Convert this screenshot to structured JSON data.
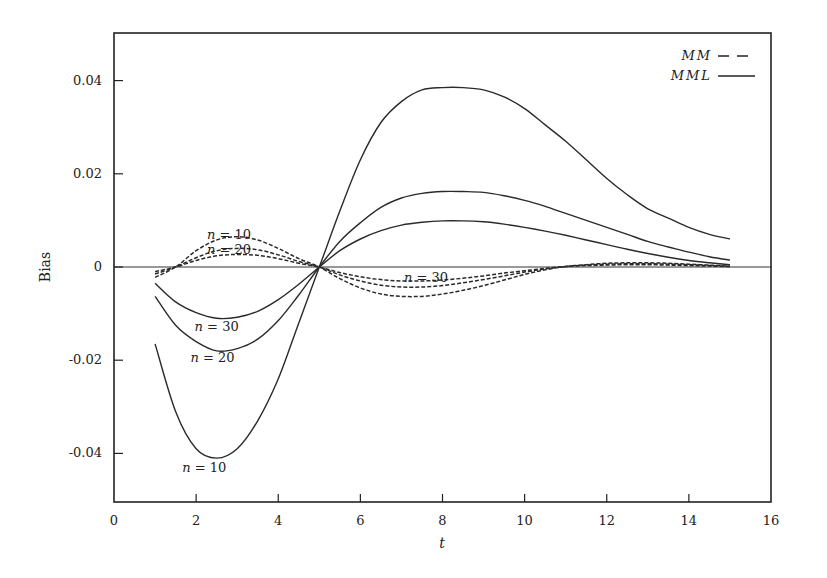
{
  "chart_data": {
    "type": "line",
    "title": "",
    "xlabel": "t",
    "ylabel": "Bias",
    "xlim": [
      0,
      16
    ],
    "ylim": [
      -0.05,
      0.05
    ],
    "xticks": [
      0,
      2,
      4,
      6,
      8,
      10,
      12,
      14,
      16
    ],
    "xtick_labels": [
      "0",
      "2",
      "4",
      "6",
      "8",
      "10",
      "12",
      "14",
      "16"
    ],
    "yticks": [
      -0.04,
      -0.02,
      0,
      0.02,
      0.04
    ],
    "ytick_labels": [
      "-0.04",
      "-0.02",
      "0",
      "0.02",
      "0.04"
    ],
    "grid": false,
    "zero_line": true,
    "legend": {
      "position": "upper right",
      "entries": [
        {
          "label": "MM",
          "style": "dashed"
        },
        {
          "label": "MML",
          "style": "solid"
        }
      ]
    },
    "x": [
      1,
      1.5,
      2,
      2.5,
      3,
      3.5,
      4,
      4.5,
      5,
      5.5,
      6,
      6.5,
      7,
      7.5,
      8,
      8.5,
      9,
      9.5,
      10,
      10.5,
      11,
      11.5,
      12,
      12.5,
      13,
      13.5,
      14,
      14.5,
      15
    ],
    "series": [
      {
        "name": "MML n = 10",
        "method": "MML",
        "n": 10,
        "style": "solid",
        "values": [
          -0.0165,
          -0.031,
          -0.039,
          -0.041,
          -0.039,
          -0.033,
          -0.024,
          -0.012,
          0.0,
          0.012,
          0.023,
          0.031,
          0.0355,
          0.038,
          0.0385,
          0.0385,
          0.038,
          0.0365,
          0.034,
          0.0305,
          0.027,
          0.023,
          0.019,
          0.0155,
          0.0125,
          0.0105,
          0.0085,
          0.007,
          0.006
        ]
      },
      {
        "name": "MML n = 20",
        "method": "MML",
        "n": 20,
        "style": "solid",
        "values": [
          -0.0063,
          -0.0125,
          -0.016,
          -0.018,
          -0.0175,
          -0.0155,
          -0.0115,
          -0.006,
          0.0,
          0.0055,
          0.0095,
          0.0128,
          0.0148,
          0.0158,
          0.0162,
          0.0162,
          0.016,
          0.0153,
          0.0143,
          0.013,
          0.0115,
          0.01,
          0.0085,
          0.007,
          0.0055,
          0.0043,
          0.0032,
          0.0022,
          0.0015
        ]
      },
      {
        "name": "MML n = 30",
        "method": "MML",
        "n": 30,
        "style": "solid",
        "values": [
          -0.0035,
          -0.0075,
          -0.0098,
          -0.011,
          -0.0108,
          -0.0095,
          -0.007,
          -0.0037,
          0.0,
          0.0035,
          0.006,
          0.0078,
          0.009,
          0.0096,
          0.0099,
          0.0099,
          0.0097,
          0.0092,
          0.0085,
          0.0077,
          0.0068,
          0.0058,
          0.0048,
          0.0038,
          0.0029,
          0.0021,
          0.0014,
          0.0009,
          0.0005
        ]
      },
      {
        "name": "MM n = 10",
        "method": "MM",
        "n": 10,
        "style": "dashed",
        "values": [
          -0.0022,
          0.0,
          0.0035,
          0.0058,
          0.0065,
          0.0058,
          0.004,
          0.0018,
          0.0,
          -0.0025,
          -0.0045,
          -0.0058,
          -0.0063,
          -0.0063,
          -0.0058,
          -0.005,
          -0.004,
          -0.0028,
          -0.0016,
          -0.0006,
          0.0001,
          0.0005,
          0.0008,
          0.0009,
          0.0009,
          0.0008,
          0.0006,
          0.0004,
          0.0002
        ]
      },
      {
        "name": "MM n = 20",
        "method": "MM",
        "n": 20,
        "style": "dashed",
        "values": [
          -0.0015,
          0.0,
          0.002,
          0.0035,
          0.004,
          0.0037,
          0.0026,
          0.0012,
          0.0,
          -0.0017,
          -0.003,
          -0.0039,
          -0.0043,
          -0.0043,
          -0.004,
          -0.0034,
          -0.0027,
          -0.0019,
          -0.0011,
          -0.0004,
          0.0001,
          0.0004,
          0.0006,
          0.0007,
          0.0007,
          0.0006,
          0.0005,
          0.0003,
          0.0001
        ]
      },
      {
        "name": "MM n = 30",
        "method": "MM",
        "n": 30,
        "style": "dashed",
        "values": [
          -0.001,
          0.0,
          0.0014,
          0.0024,
          0.0027,
          0.0025,
          0.0018,
          0.0008,
          0.0,
          -0.0012,
          -0.0021,
          -0.0027,
          -0.003,
          -0.003,
          -0.0028,
          -0.0024,
          -0.0019,
          -0.0013,
          -0.0008,
          -0.0003,
          0.0001,
          0.0003,
          0.0004,
          0.0005,
          0.0005,
          0.0004,
          0.0003,
          0.0002,
          0.0001
        ]
      }
    ],
    "annotations": [
      {
        "text": "n = 10",
        "x": 2.8,
        "y": 0.0068,
        "refers_to": "MM n = 10"
      },
      {
        "text": "n = 20",
        "x": 2.8,
        "y": 0.0037,
        "refers_to": "MM n = 20"
      },
      {
        "text": "n = 30",
        "x": 7.6,
        "y": -0.0023,
        "refers_to": "MM n = 30"
      },
      {
        "text": "n = 30",
        "x": 2.5,
        "y": -0.0128,
        "refers_to": "MML n = 30"
      },
      {
        "text": "n = 20",
        "x": 2.4,
        "y": -0.0195,
        "refers_to": "MML n = 20"
      },
      {
        "text": "n = 10",
        "x": 2.2,
        "y": -0.0432,
        "refers_to": "MML n = 10"
      }
    ]
  },
  "labels": {
    "xlabel": "t",
    "ylabel": "Bias",
    "legend_mm": "MM",
    "legend_mml": "MML"
  },
  "colors": {
    "line": "#2a2a2a",
    "axis": "#222222",
    "background": "#ffffff"
  }
}
